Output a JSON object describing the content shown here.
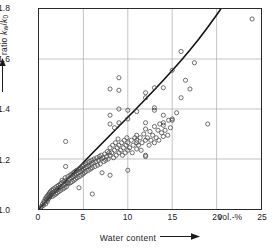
{
  "chart_data": {
    "type": "scatter",
    "title": "",
    "xlabel": "Water content",
    "ylabel": "ratio k_w / k_0",
    "xunit": "vol.-%",
    "xlim": [
      0,
      25
    ],
    "ylim": [
      1.0,
      1.8
    ],
    "xticks": [
      0,
      5,
      10,
      15,
      20,
      25
    ],
    "xticklabels": [
      "0",
      "5",
      "10",
      "15",
      "20",
      "25"
    ],
    "yticks": [
      1.0,
      1.2,
      1.4,
      1.6,
      1.8
    ],
    "yticklabels": [
      "1.0",
      "1.2",
      "1.4",
      "1.6",
      "1.8"
    ],
    "grid": true,
    "legend": null,
    "marker": "open-circle",
    "series": [
      {
        "name": "measurements",
        "type": "scatter",
        "points": [
          [
            0.2,
            1.005
          ],
          [
            0.3,
            1.01
          ],
          [
            0.4,
            1.02
          ],
          [
            0.5,
            1.015
          ],
          [
            0.55,
            1.03
          ],
          [
            0.6,
            1.025
          ],
          [
            0.7,
            1.04
          ],
          [
            0.75,
            1.02
          ],
          [
            0.8,
            1.045
          ],
          [
            0.85,
            1.035
          ],
          [
            0.9,
            1.05
          ],
          [
            0.95,
            1.03
          ],
          [
            1.0,
            1.055
          ],
          [
            1.05,
            1.04
          ],
          [
            1.1,
            1.06
          ],
          [
            1.15,
            1.045
          ],
          [
            1.2,
            1.065
          ],
          [
            1.25,
            1.05
          ],
          [
            1.3,
            1.07
          ],
          [
            1.35,
            1.055
          ],
          [
            1.4,
            1.06
          ],
          [
            1.45,
            1.075
          ],
          [
            1.5,
            1.05
          ],
          [
            1.55,
            1.065
          ],
          [
            1.6,
            1.08
          ],
          [
            1.7,
            1.055
          ],
          [
            1.75,
            1.07
          ],
          [
            1.8,
            1.085
          ],
          [
            1.9,
            1.06
          ],
          [
            1.95,
            1.075
          ],
          [
            2.0,
            1.09
          ],
          [
            2.05,
            1.065
          ],
          [
            2.1,
            1.08
          ],
          [
            2.2,
            1.095
          ],
          [
            2.25,
            1.07
          ],
          [
            2.3,
            1.085
          ],
          [
            2.4,
            1.1
          ],
          [
            2.45,
            1.075
          ],
          [
            2.5,
            1.09
          ],
          [
            2.55,
            1.105
          ],
          [
            2.6,
            1.115
          ],
          [
            2.7,
            1.08
          ],
          [
            2.75,
            1.095
          ],
          [
            2.8,
            1.11
          ],
          [
            2.9,
            1.085
          ],
          [
            2.95,
            1.125
          ],
          [
            3.0,
            1.1
          ],
          [
            3.0,
            1.17
          ],
          [
            3.0,
            1.27
          ],
          [
            3.05,
            1.115
          ],
          [
            3.1,
            1.09
          ],
          [
            3.2,
            1.105
          ],
          [
            3.25,
            1.13
          ],
          [
            3.3,
            1.1
          ],
          [
            3.4,
            1.12
          ],
          [
            3.5,
            1.135
          ],
          [
            3.55,
            1.105
          ],
          [
            3.6,
            1.125
          ],
          [
            3.7,
            1.14
          ],
          [
            3.75,
            1.11
          ],
          [
            3.8,
            1.13
          ],
          [
            3.9,
            1.145
          ],
          [
            3.95,
            1.115
          ],
          [
            4.0,
            1.135
          ],
          [
            4.05,
            1.15
          ],
          [
            4.1,
            1.12
          ],
          [
            4.2,
            1.14
          ],
          [
            4.25,
            1.155
          ],
          [
            4.3,
            1.125
          ],
          [
            4.4,
            1.145
          ],
          [
            4.5,
            1.16
          ],
          [
            4.5,
            1.085
          ],
          [
            4.55,
            1.13
          ],
          [
            4.6,
            1.15
          ],
          [
            4.7,
            1.165
          ],
          [
            4.75,
            1.135
          ],
          [
            4.8,
            1.155
          ],
          [
            4.9,
            1.17
          ],
          [
            4.95,
            1.14
          ],
          [
            5.0,
            1.16
          ],
          [
            5.0,
            1.175
          ],
          [
            5.1,
            1.145
          ],
          [
            5.2,
            1.165
          ],
          [
            5.25,
            1.18
          ],
          [
            5.3,
            1.15
          ],
          [
            5.4,
            1.17
          ],
          [
            5.5,
            1.185
          ],
          [
            5.55,
            1.155
          ],
          [
            5.6,
            1.175
          ],
          [
            5.7,
            1.19
          ],
          [
            5.8,
            1.16
          ],
          [
            5.9,
            1.18
          ],
          [
            5.95,
            1.195
          ],
          [
            6.0,
            1.165
          ],
          [
            6.0,
            1.06
          ],
          [
            6.1,
            1.185
          ],
          [
            6.2,
            1.2
          ],
          [
            6.3,
            1.17
          ],
          [
            6.4,
            1.19
          ],
          [
            6.5,
            1.205
          ],
          [
            6.6,
            1.175
          ],
          [
            6.7,
            1.195
          ],
          [
            6.8,
            1.21
          ],
          [
            6.9,
            1.18
          ],
          [
            7.0,
            1.2
          ],
          [
            7.0,
            1.215
          ],
          [
            7.1,
            1.145
          ],
          [
            7.2,
            1.205
          ],
          [
            7.3,
            1.19
          ],
          [
            7.4,
            1.22
          ],
          [
            7.5,
            1.195
          ],
          [
            7.6,
            1.21
          ],
          [
            7.7,
            1.23
          ],
          [
            7.8,
            1.2
          ],
          [
            7.9,
            1.225
          ],
          [
            8.0,
            1.135
          ],
          [
            8.0,
            1.215
          ],
          [
            8.0,
            1.245
          ],
          [
            8.0,
            1.34
          ],
          [
            8.0,
            1.375
          ],
          [
            8.0,
            1.48
          ],
          [
            8.2,
            1.225
          ],
          [
            8.3,
            1.255
          ],
          [
            8.4,
            1.205
          ],
          [
            8.5,
            1.235
          ],
          [
            8.5,
            1.325
          ],
          [
            8.6,
            1.265
          ],
          [
            8.7,
            1.215
          ],
          [
            8.8,
            1.245
          ],
          [
            8.9,
            1.28
          ],
          [
            9.0,
            1.225
          ],
          [
            9.0,
            1.255
          ],
          [
            9.0,
            1.345
          ],
          [
            9.0,
            1.4
          ],
          [
            9.0,
            1.475
          ],
          [
            9.0,
            1.525
          ],
          [
            9.2,
            1.235
          ],
          [
            9.3,
            1.265
          ],
          [
            9.4,
            1.215
          ],
          [
            9.5,
            1.245
          ],
          [
            9.6,
            1.275
          ],
          [
            9.7,
            1.225
          ],
          [
            9.8,
            1.255
          ],
          [
            9.9,
            1.285
          ],
          [
            10.0,
            1.155
          ],
          [
            10.0,
            1.235
          ],
          [
            10.0,
            1.265
          ],
          [
            10.0,
            1.36
          ],
          [
            10.0,
            1.395
          ],
          [
            10.2,
            1.245
          ],
          [
            10.4,
            1.275
          ],
          [
            10.5,
            1.225
          ],
          [
            10.6,
            1.255
          ],
          [
            10.8,
            1.285
          ],
          [
            11.0,
            1.24
          ],
          [
            11.0,
            1.265
          ],
          [
            11.0,
            1.275
          ],
          [
            11.0,
            1.295
          ],
          [
            11.0,
            1.39
          ],
          [
            11.2,
            1.255
          ],
          [
            11.4,
            1.285
          ],
          [
            11.5,
            1.235
          ],
          [
            11.6,
            1.265
          ],
          [
            11.8,
            1.3
          ],
          [
            12.0,
            1.21
          ],
          [
            12.0,
            1.215
          ],
          [
            12.0,
            1.275
          ],
          [
            12.0,
            1.32
          ],
          [
            12.0,
            1.345
          ],
          [
            12.0,
            1.445
          ],
          [
            12.0,
            1.465
          ],
          [
            12.2,
            1.285
          ],
          [
            12.4,
            1.255
          ],
          [
            12.5,
            1.31
          ],
          [
            12.6,
            1.275
          ],
          [
            12.8,
            1.295
          ],
          [
            13.0,
            1.265
          ],
          [
            13.0,
            1.33
          ],
          [
            13.0,
            1.395
          ],
          [
            13.0,
            1.405
          ],
          [
            13.0,
            1.485
          ],
          [
            13.2,
            1.285
          ],
          [
            13.4,
            1.315
          ],
          [
            13.5,
            1.275
          ],
          [
            13.6,
            1.34
          ],
          [
            13.8,
            1.305
          ],
          [
            14.0,
            1.29
          ],
          [
            14.0,
            1.335
          ],
          [
            14.0,
            1.345
          ],
          [
            14.0,
            1.375
          ],
          [
            14.0,
            1.485
          ],
          [
            14.2,
            1.315
          ],
          [
            14.5,
            1.295
          ],
          [
            14.6,
            1.355
          ],
          [
            14.8,
            1.325
          ],
          [
            15.0,
            1.355
          ],
          [
            15.0,
            1.36
          ],
          [
            15.0,
            1.555
          ],
          [
            15.5,
            1.385
          ],
          [
            16.0,
            1.445
          ],
          [
            16.0,
            1.63
          ],
          [
            16.5,
            1.515
          ],
          [
            17.0,
            1.48
          ],
          [
            17.5,
            1.585
          ],
          [
            19.0,
            1.34
          ],
          [
            24.0,
            1.76
          ]
        ]
      },
      {
        "name": "fitted-curve",
        "type": "line",
        "points": [
          [
            0.0,
            1.0
          ],
          [
            1.0,
            1.038
          ],
          [
            2.0,
            1.075
          ],
          [
            3.0,
            1.112
          ],
          [
            4.0,
            1.149
          ],
          [
            5.0,
            1.186
          ],
          [
            6.0,
            1.223
          ],
          [
            7.0,
            1.259
          ],
          [
            8.0,
            1.295
          ],
          [
            9.0,
            1.331
          ],
          [
            10.0,
            1.367
          ],
          [
            11.0,
            1.403
          ],
          [
            12.0,
            1.44
          ],
          [
            13.0,
            1.477
          ],
          [
            14.0,
            1.515
          ],
          [
            15.0,
            1.554
          ],
          [
            16.0,
            1.594
          ],
          [
            17.0,
            1.636
          ],
          [
            18.0,
            1.68
          ],
          [
            19.0,
            1.727
          ],
          [
            20.0,
            1.776
          ],
          [
            20.6,
            1.807
          ]
        ]
      }
    ]
  },
  "axes": {
    "y_label_prefix": "ratio",
    "y_label_num": "k",
    "y_label_num_sub": "w",
    "y_label_slash": "/",
    "y_label_den": "k",
    "y_label_den_sub": "0",
    "x_label": "Water content",
    "x_unit": "vol.-%"
  },
  "style": {
    "frame_color": "#2a2a2a",
    "grid_color": "#a8a8a8",
    "marker_color": "#4a4a4a",
    "curve_color": "#111111",
    "background": "#ffffff"
  }
}
